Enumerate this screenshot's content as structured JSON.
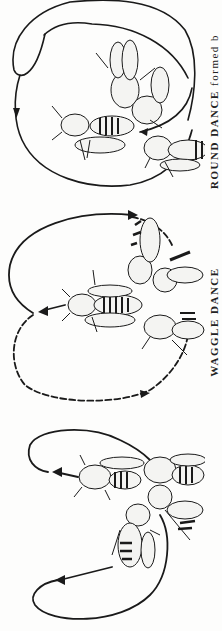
{
  "figures": [
    {
      "id": "round",
      "label": "round-dance-diagram",
      "path_style": "solid",
      "bees": 5
    },
    {
      "id": "waggle",
      "label": "waggle-dance-diagram",
      "path_style": "dashed",
      "bees": 4
    },
    {
      "id": "third",
      "label": "sickle-dance-diagram",
      "path_style": "solid",
      "bees": 4
    }
  ],
  "caption": {
    "parts": [
      {
        "text": "",
        "style": "plain"
      },
      {
        "text": "WAGGLE DANCE",
        "style": "sc"
      },
      {
        "text": "   ",
        "style": "plain"
      },
      {
        "text": "ROUND DANCE",
        "style": "sc"
      },
      {
        "text": " formed b",
        "style": "plain"
      }
    ]
  },
  "colors": {
    "ink": "#1a1a1a",
    "paper": "#fdfdfc",
    "wing": "#f4f4f2"
  }
}
